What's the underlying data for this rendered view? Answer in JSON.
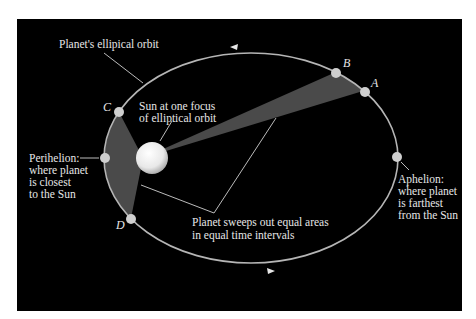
{
  "labels": {
    "orbit": "Planet's ellipical orbit",
    "sun_line1": "Sun at one focus",
    "sun_line2": "of elliptical orbit",
    "perihelion_1": "Perihelion:",
    "perihelion_2": "where planet",
    "perihelion_3": "is closest",
    "perihelion_4": "to the Sun",
    "aphelion_1": "Aphelion:",
    "aphelion_2": "where planet",
    "aphelion_3": "is farthest",
    "aphelion_4": "from the Sun",
    "sweeps_1": "Planet sweeps out equal areas",
    "sweeps_2": "in equal time intervals"
  },
  "points": {
    "A": "A",
    "B": "B",
    "C": "C",
    "D": "D"
  },
  "colors": {
    "background": "#000000",
    "orbit": "#b5b5b5",
    "wedge": "#4a4a4a",
    "text": "#e6e6e6"
  }
}
